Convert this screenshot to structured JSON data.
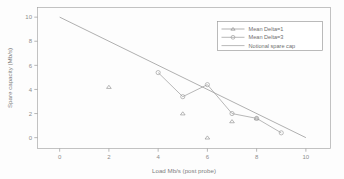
{
  "chart_data": {
    "type": "scatter",
    "title": "",
    "xlabel": "Load Mb/s (post probe)",
    "ylabel": "Spare capacity (Mb/s)",
    "xlim": [
      -0.9,
      11.0
    ],
    "ylim": [
      -0.9,
      10.8
    ],
    "xticks": [
      0,
      2,
      4,
      6,
      8,
      10
    ],
    "yticks": [
      0,
      2,
      4,
      6,
      8,
      10
    ],
    "xticklabels": [
      "0",
      "2",
      "4",
      "6",
      "8",
      "10"
    ],
    "yticklabels": [
      "0",
      "2",
      "4",
      "6",
      "8",
      "10"
    ],
    "grid": false,
    "legend_position": "upper right",
    "series": [
      {
        "name": "Mean Delta=1",
        "marker": "triangle",
        "connected": false,
        "color": "#8f8f8f",
        "points": [
          {
            "x": 2,
            "y": 4.2
          },
          {
            "x": 5,
            "y": 2.0
          },
          {
            "x": 6,
            "y": 0.0
          },
          {
            "x": 7,
            "y": 1.35
          },
          {
            "x": 8,
            "y": 1.6
          }
        ]
      },
      {
        "name": "Mean Delta=3",
        "marker": "circle",
        "connected": true,
        "color": "#9a9a9a",
        "points": [
          {
            "x": 4,
            "y": 5.4
          },
          {
            "x": 5,
            "y": 3.4
          },
          {
            "x": 6,
            "y": 4.4
          },
          {
            "x": 7,
            "y": 2.0
          },
          {
            "x": 8,
            "y": 1.6
          },
          {
            "x": 9,
            "y": 0.4
          }
        ]
      },
      {
        "name": "Notional spare cap",
        "marker": "none",
        "connected": true,
        "color": "#9c9c9c",
        "points": [
          {
            "x": 0,
            "y": 10.0
          },
          {
            "x": 10,
            "y": 0.0
          }
        ]
      }
    ]
  },
  "legend": {
    "entries": [
      {
        "label": "Mean Delta=1"
      },
      {
        "label": "Mean Delta=3"
      },
      {
        "label": "Notional spare cap"
      }
    ]
  },
  "axes": {
    "x_title": "Load Mb/s (post probe)",
    "y_title": "Spare capacity (Mb/s)"
  }
}
